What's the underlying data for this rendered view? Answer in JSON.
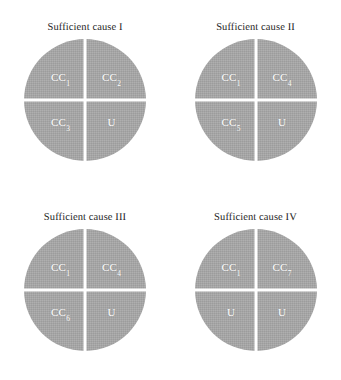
{
  "figure": {
    "background_color": "#ffffff",
    "pie_color": "#a8a8a8",
    "divider_color": "#ffffff",
    "label_color": "#ffffff",
    "title_color": "#242424",
    "panels": [
      {
        "title": "Sufficient cause I",
        "quadrants": [
          {
            "position": "top-left",
            "base": "CC",
            "sub": "1"
          },
          {
            "position": "top-right",
            "base": "CC",
            "sub": "2"
          },
          {
            "position": "bottom-left",
            "base": "CC",
            "sub": "3"
          },
          {
            "position": "bottom-right",
            "base": "U",
            "sub": ""
          }
        ]
      },
      {
        "title": "Sufficient cause II",
        "quadrants": [
          {
            "position": "top-left",
            "base": "CC",
            "sub": "1"
          },
          {
            "position": "top-right",
            "base": "CC",
            "sub": "4"
          },
          {
            "position": "bottom-left",
            "base": "CC",
            "sub": "5"
          },
          {
            "position": "bottom-right",
            "base": "U",
            "sub": ""
          }
        ]
      },
      {
        "title": "Sufficient cause III",
        "quadrants": [
          {
            "position": "top-left",
            "base": "CC",
            "sub": "1"
          },
          {
            "position": "top-right",
            "base": "CC",
            "sub": "4"
          },
          {
            "position": "bottom-left",
            "base": "CC",
            "sub": "6"
          },
          {
            "position": "bottom-right",
            "base": "U",
            "sub": ""
          }
        ]
      },
      {
        "title": "Sufficient cause IV",
        "quadrants": [
          {
            "position": "top-left",
            "base": "CC",
            "sub": "1"
          },
          {
            "position": "top-right",
            "base": "CC",
            "sub": "7"
          },
          {
            "position": "bottom-left",
            "base": "U",
            "sub": ""
          },
          {
            "position": "bottom-right",
            "base": "U",
            "sub": ""
          }
        ]
      }
    ]
  },
  "chart_data": {
    "type": "pie",
    "title": "",
    "layout": "2x2 grid of equal-slice pie diagrams (Rothman sufficient-cause pies)",
    "panels": [
      {
        "title": "Sufficient cause I",
        "categories": [
          "CC1",
          "CC2",
          "CC3",
          "U"
        ],
        "values": [
          25,
          25,
          25,
          25
        ]
      },
      {
        "title": "Sufficient cause II",
        "categories": [
          "CC1",
          "CC4",
          "CC5",
          "U"
        ],
        "values": [
          25,
          25,
          25,
          25
        ]
      },
      {
        "title": "Sufficient cause III",
        "categories": [
          "CC1",
          "CC4",
          "CC6",
          "U"
        ],
        "values": [
          25,
          25,
          25,
          25
        ]
      },
      {
        "title": "Sufficient cause IV",
        "categories": [
          "CC1",
          "CC7",
          "U",
          "U"
        ],
        "values": [
          25,
          25,
          25,
          25
        ]
      }
    ],
    "slice_color": "#a8a8a8",
    "label_color": "#ffffff",
    "legend": "none",
    "grid": false
  }
}
